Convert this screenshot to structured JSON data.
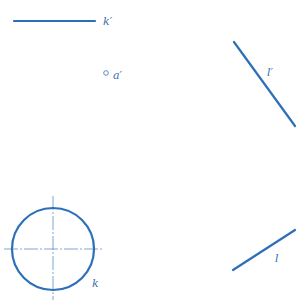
{
  "diagram": {
    "colors": {
      "line": "#2d6fb8",
      "centerline": "#6f9bd1",
      "label": "#3a6fb0",
      "background": "#ffffff"
    },
    "elements": {
      "k_prime": {
        "label": "k′",
        "line": {
          "x1": 14,
          "y1": 21,
          "x2": 95,
          "y2": 21
        },
        "label_pos": {
          "x": 103,
          "y": 25
        }
      },
      "a_prime": {
        "label": "a′",
        "point": {
          "cx": 106,
          "cy": 73,
          "r": 2.3
        },
        "label_pos": {
          "x": 113,
          "y": 79
        }
      },
      "l_prime": {
        "label": "l′",
        "line": {
          "x1": 234,
          "y1": 42,
          "x2": 295,
          "y2": 126
        },
        "label_pos": {
          "x": 267,
          "y": 76
        }
      },
      "k": {
        "label": "k",
        "circle": {
          "cx": 53,
          "cy": 249,
          "r": 41
        },
        "centerline_h": {
          "x1": 4,
          "y1": 249,
          "x2": 102,
          "y2": 249
        },
        "centerline_v": {
          "x1": 53,
          "y1": 196,
          "x2": 53,
          "y2": 300
        },
        "label_pos": {
          "x": 92,
          "y": 287
        }
      },
      "l": {
        "label": "l",
        "line": {
          "x1": 233,
          "y1": 270,
          "x2": 295,
          "y2": 230
        },
        "label_pos": {
          "x": 275,
          "y": 262
        }
      }
    }
  }
}
